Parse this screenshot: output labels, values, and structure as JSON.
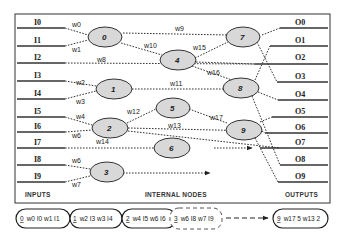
{
  "diagram": {
    "inputs": {
      "label": "INPUTS",
      "items": [
        "I0",
        "I1",
        "I2",
        "I3",
        "I4",
        "I5",
        "I6",
        "I7",
        "I8",
        "I9"
      ]
    },
    "outputs": {
      "label": "OUTPUTS",
      "items": [
        "O0",
        "O1",
        "O2",
        "O3",
        "O4",
        "O5",
        "O6",
        "O7",
        "O8",
        "O9"
      ]
    },
    "internal_nodes": {
      "label": "INTERNAL NODES",
      "nodes": [
        {
          "id": "0",
          "label": "0"
        },
        {
          "id": "1",
          "label": "1"
        },
        {
          "id": "2",
          "label": "2"
        },
        {
          "id": "3",
          "label": "3"
        },
        {
          "id": "4",
          "label": "4"
        },
        {
          "id": "5",
          "label": "5"
        },
        {
          "id": "6",
          "label": "6"
        },
        {
          "id": "7",
          "label": "7"
        },
        {
          "id": "8",
          "label": "8"
        },
        {
          "id": "9",
          "label": "9"
        }
      ]
    },
    "weights": {
      "w0": "w0",
      "w1": "w1",
      "w2": "w2",
      "w3": "w3",
      "w4": "w4",
      "w5": "w6",
      "w6": "w6",
      "w7": "w7",
      "w8": "w8",
      "w9": "w9",
      "w10": "w10",
      "w11": "w11",
      "w12": "w12",
      "w13": "w13",
      "w14": "w14",
      "w15": "w15",
      "w16": "w16",
      "w17": "w17"
    },
    "edges": [
      {
        "from": "I0",
        "to": "0",
        "weight": "w0"
      },
      {
        "from": "I1",
        "to": "0",
        "weight": "w1"
      },
      {
        "from": "I3",
        "to": "1",
        "weight": "w2"
      },
      {
        "from": "I4",
        "to": "1",
        "weight": "w3"
      },
      {
        "from": "I5",
        "to": "2",
        "weight": "w4"
      },
      {
        "from": "I6",
        "to": "2",
        "weight": "w6"
      },
      {
        "from": "I8",
        "to": "3",
        "weight": "w6"
      },
      {
        "from": "I9",
        "to": "3",
        "weight": "w7"
      },
      {
        "from": "I2",
        "to": "O2",
        "weight": "w8"
      },
      {
        "from": "0",
        "to": "7",
        "weight": "w9"
      },
      {
        "from": "0",
        "to": "4",
        "weight": "w10"
      },
      {
        "from": "1",
        "to": "8",
        "weight": "w11"
      },
      {
        "from": "2",
        "to": "5",
        "weight": "w12"
      },
      {
        "from": "2",
        "to": "9",
        "weight": "w13"
      },
      {
        "from": "I7",
        "to": "6",
        "weight": "w14"
      },
      {
        "from": "4",
        "to": "7",
        "weight": "w15"
      },
      {
        "from": "4",
        "to": "8",
        "weight": "w16"
      },
      {
        "from": "5",
        "to": "9",
        "weight": "w17"
      }
    ]
  },
  "genome": {
    "genes": [
      {
        "id": "0",
        "text": "w0 I0 w1 I1",
        "style": "solid"
      },
      {
        "id": "1",
        "text": "w2 I3 w3 I4",
        "style": "solid"
      },
      {
        "id": "2",
        "text": "w4 I5 w6 I6",
        "style": "solid"
      },
      {
        "id": "3",
        "text": "w6 I8 w7 I9",
        "style": "dashed"
      },
      {
        "id": "9",
        "text": "w17 5 w13 2",
        "style": "solid"
      }
    ]
  }
}
